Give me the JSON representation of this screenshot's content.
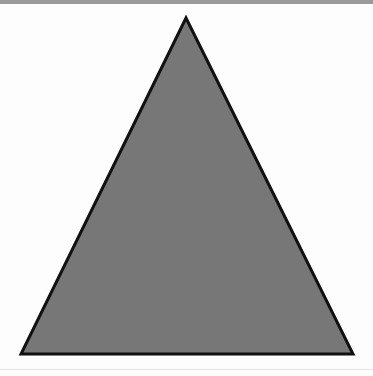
{
  "figure": {
    "shape": "triangle-icon",
    "fill_color": "#777777",
    "stroke_color": "#111111",
    "background_color": "#fdfdfd",
    "top_band_color": "#9a9a9a"
  }
}
